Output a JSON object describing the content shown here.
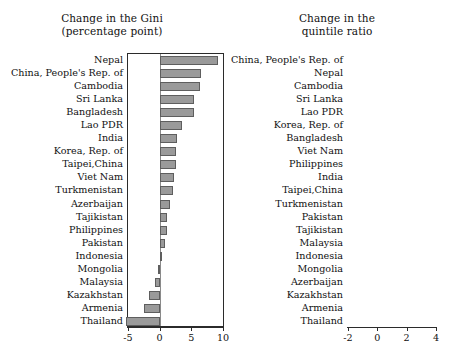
{
  "figure": {
    "background": "#ffffff",
    "bar_fill": "#9a9a9a",
    "bar_stroke": "#5e5e5e",
    "axis_color": "#2b2b2b"
  },
  "chart_data": [
    {
      "type": "bar",
      "orientation": "horizontal",
      "title": "Change in the Gini\n(percentage point)",
      "title_line1": "Change in the Gini",
      "title_line2": "(percentage point)",
      "xlabel": "",
      "ylabel": "",
      "xlim": [
        -5,
        10
      ],
      "xticks": [
        -5,
        0,
        5,
        10
      ],
      "xticklabels": [
        "-5",
        "0",
        "5",
        "10"
      ],
      "grid": false,
      "legend": "none",
      "categories": [
        "Nepal",
        "China, People's Rep. of",
        "Cambodia",
        "Sri Lanka",
        "Bangladesh",
        "Lao PDR",
        "India",
        "Korea, Rep. of",
        "Taipei,China",
        "Viet Nam",
        "Turkmenistan",
        "Azerbaijan",
        "Tajikistan",
        "Philippines",
        "Pakistan",
        "Indonesia",
        "Mongolia",
        "Malaysia",
        "Kazakhstan",
        "Armenia",
        "Thailand"
      ],
      "values": [
        9.2,
        6.5,
        6.3,
        5.4,
        5.4,
        3.6,
        2.7,
        2.6,
        2.6,
        2.2,
        2.1,
        1.6,
        1.2,
        1.1,
        0.8,
        0.1,
        -0.2,
        -0.8,
        -1.7,
        -2.4,
        -5.3
      ]
    },
    {
      "type": "bar",
      "orientation": "horizontal",
      "title": "Change in the\nquintile ratio",
      "title_line1": "Change in the",
      "title_line2": "quintile ratio",
      "xlabel": "",
      "ylabel": "",
      "xlim": [
        -2,
        4
      ],
      "xticks": [
        -2,
        0,
        2,
        4
      ],
      "xticklabels": [
        "-2",
        "0",
        "2",
        "4"
      ],
      "grid": false,
      "legend": "none",
      "categories": [
        "China, People's Rep. of",
        "Nepal",
        "Cambodia",
        "Sri Lanka",
        "Lao PDR",
        "Korea, Rep. of",
        "Bangladesh",
        "Viet Nam",
        "Philippines",
        "India",
        "Taipei,China",
        "Turkmenistan",
        "Pakistan",
        "Tajikistan",
        "Malaysia",
        "Indonesia",
        "Mongolia",
        "Azerbaijan",
        "Kazakhstan",
        "Armenia",
        "Thailand"
      ],
      "values": [
        4.0,
        3.5,
        1.85,
        1.6,
        1.0,
        0.95,
        0.8,
        0.7,
        0.65,
        0.6,
        0.55,
        0.45,
        0.22,
        0.15,
        0.04,
        0.04,
        -0.05,
        -0.08,
        -0.75,
        -0.9,
        -1.75
      ]
    }
  ]
}
